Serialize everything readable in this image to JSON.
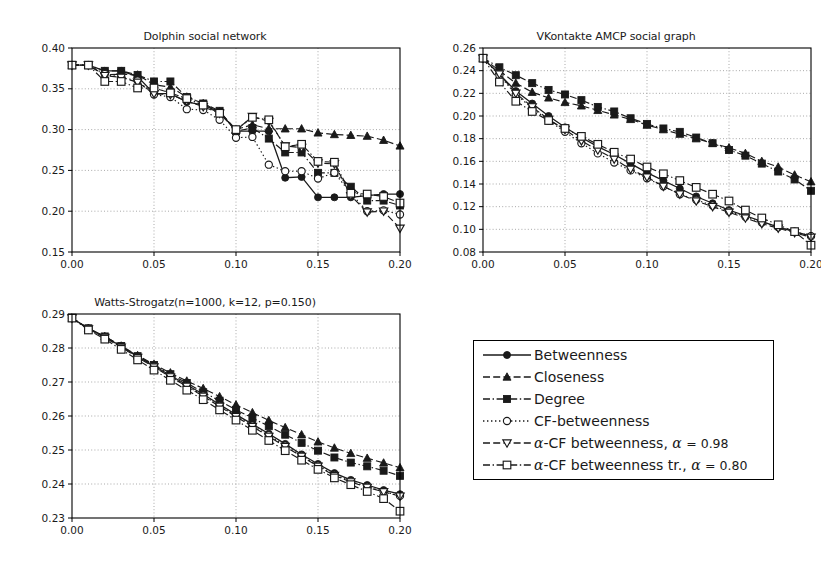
{
  "figure": {
    "background": "#ffffff",
    "ink": "#1a1a1a",
    "grid_color": "#9a9a9a"
  },
  "chart_data": [
    {
      "type": "line",
      "id": "dolphin",
      "title": "Dolphin social network",
      "xlabel": "",
      "ylabel": "",
      "xlim": [
        0.0,
        0.2
      ],
      "ylim": [
        0.15,
        0.4
      ],
      "xticks": [
        0.0,
        0.05,
        0.1,
        0.15,
        0.2
      ],
      "xticklabels": [
        "0.00",
        "0.05",
        "0.10",
        "0.15",
        "0.20"
      ],
      "yticks": [
        0.15,
        0.2,
        0.25,
        0.3,
        0.35,
        0.4
      ],
      "yticklabels": [
        "0.15",
        "0.20",
        "0.25",
        "0.30",
        "0.35",
        "0.40"
      ],
      "grid": true,
      "legend_position": "external",
      "x": [
        0.0,
        0.01,
        0.02,
        0.03,
        0.04,
        0.05,
        0.06,
        0.07,
        0.08,
        0.09,
        0.1,
        0.11,
        0.12,
        0.13,
        0.14,
        0.15,
        0.16,
        0.17,
        0.18,
        0.19,
        0.2
      ],
      "series": [
        {
          "name": "Betweenness",
          "values": [
            0.379,
            0.379,
            0.372,
            0.372,
            0.365,
            0.344,
            0.344,
            0.334,
            0.33,
            0.322,
            0.298,
            0.298,
            0.298,
            0.241,
            0.242,
            0.217,
            0.217,
            0.217,
            0.219,
            0.221,
            0.221
          ]
        },
        {
          "name": "Closeness",
          "values": [
            0.379,
            0.379,
            0.367,
            0.368,
            0.367,
            0.355,
            0.352,
            0.34,
            0.332,
            0.322,
            0.3,
            0.306,
            0.301,
            0.301,
            0.301,
            0.296,
            0.294,
            0.293,
            0.292,
            0.287,
            0.28
          ]
        },
        {
          "name": "Degree",
          "values": [
            0.379,
            0.379,
            0.372,
            0.372,
            0.367,
            0.359,
            0.359,
            0.34,
            0.332,
            0.323,
            0.298,
            0.302,
            0.289,
            0.272,
            0.272,
            0.247,
            0.247,
            0.23,
            0.213,
            0.213,
            0.207
          ]
        },
        {
          "name": "CF-betweenness",
          "values": [
            0.379,
            0.379,
            0.368,
            0.364,
            0.36,
            0.343,
            0.34,
            0.325,
            0.324,
            0.312,
            0.29,
            0.291,
            0.257,
            0.249,
            0.249,
            0.24,
            0.247,
            0.222,
            0.2,
            0.201,
            0.196
          ]
        },
        {
          "name": "alpha-CF betweenness",
          "values": [
            0.379,
            0.379,
            0.366,
            0.364,
            0.358,
            0.344,
            0.343,
            0.335,
            0.328,
            0.32,
            0.299,
            0.316,
            0.31,
            0.28,
            0.278,
            0.259,
            0.258,
            0.219,
            0.199,
            0.2,
            0.179
          ]
        },
        {
          "name": "alpha-CF betweenness tr.",
          "values": [
            0.379,
            0.379,
            0.359,
            0.359,
            0.351,
            0.351,
            0.345,
            0.338,
            0.33,
            0.32,
            0.3,
            0.315,
            0.312,
            0.279,
            0.282,
            0.261,
            0.26,
            0.222,
            0.221,
            0.218,
            0.21
          ]
        }
      ]
    },
    {
      "type": "line",
      "id": "vkontakte",
      "title": "VKontakte AMCP social graph",
      "xlabel": "",
      "ylabel": "",
      "xlim": [
        0.0,
        0.2
      ],
      "ylim": [
        0.08,
        0.26
      ],
      "xticks": [
        0.0,
        0.05,
        0.1,
        0.15,
        0.2
      ],
      "xticklabels": [
        "0.00",
        "0.05",
        "0.10",
        "0.15",
        "0.20"
      ],
      "yticks": [
        0.08,
        0.1,
        0.12,
        0.14,
        0.16,
        0.18,
        0.2,
        0.22,
        0.24,
        0.26
      ],
      "yticklabels": [
        "0.08",
        "0.10",
        "0.12",
        "0.14",
        "0.16",
        "0.18",
        "0.20",
        "0.22",
        "0.24",
        "0.26"
      ],
      "grid": true,
      "legend_position": "external",
      "x": [
        0.0,
        0.01,
        0.02,
        0.03,
        0.04,
        0.05,
        0.06,
        0.07,
        0.08,
        0.09,
        0.1,
        0.11,
        0.12,
        0.13,
        0.14,
        0.15,
        0.16,
        0.17,
        0.18,
        0.19,
        0.2
      ],
      "series": [
        {
          "name": "Betweenness",
          "values": [
            0.251,
            0.237,
            0.222,
            0.211,
            0.2,
            0.19,
            0.181,
            0.173,
            0.166,
            0.158,
            0.15,
            0.143,
            0.136,
            0.129,
            0.123,
            0.117,
            0.112,
            0.107,
            0.102,
            0.098,
            0.094
          ]
        },
        {
          "name": "Closeness",
          "values": [
            0.251,
            0.24,
            0.229,
            0.221,
            0.216,
            0.212,
            0.209,
            0.205,
            0.201,
            0.197,
            0.192,
            0.188,
            0.184,
            0.18,
            0.176,
            0.172,
            0.167,
            0.16,
            0.155,
            0.148,
            0.142
          ]
        },
        {
          "name": "Degree",
          "values": [
            0.251,
            0.243,
            0.236,
            0.229,
            0.223,
            0.219,
            0.214,
            0.208,
            0.204,
            0.198,
            0.193,
            0.189,
            0.186,
            0.181,
            0.176,
            0.17,
            0.165,
            0.158,
            0.151,
            0.144,
            0.134
          ]
        },
        {
          "name": "CF-betweenness",
          "values": [
            0.251,
            0.236,
            0.219,
            0.207,
            0.196,
            0.186,
            0.176,
            0.167,
            0.159,
            0.152,
            0.145,
            0.138,
            0.131,
            0.126,
            0.121,
            0.116,
            0.111,
            0.106,
            0.102,
            0.098,
            0.094
          ]
        },
        {
          "name": "alpha-CF betweenness",
          "values": [
            0.251,
            0.237,
            0.22,
            0.208,
            0.197,
            0.188,
            0.178,
            0.17,
            0.162,
            0.153,
            0.146,
            0.138,
            0.131,
            0.125,
            0.12,
            0.115,
            0.11,
            0.105,
            0.101,
            0.097,
            0.093
          ]
        },
        {
          "name": "alpha-CF betweenness tr.",
          "values": [
            0.251,
            0.23,
            0.213,
            0.204,
            0.196,
            0.189,
            0.182,
            0.175,
            0.168,
            0.162,
            0.155,
            0.149,
            0.143,
            0.137,
            0.131,
            0.125,
            0.117,
            0.11,
            0.104,
            0.098,
            0.086
          ]
        }
      ]
    },
    {
      "type": "line",
      "id": "watts-strogatz",
      "title": "Watts-Strogatz(n=1000, k=12, p=0.150)",
      "xlabel": "",
      "ylabel": "",
      "xlim": [
        0.0,
        0.2
      ],
      "ylim": [
        0.23,
        0.29
      ],
      "xticks": [
        0.0,
        0.05,
        0.1,
        0.15,
        0.2
      ],
      "xticklabels": [
        "0.00",
        "0.05",
        "0.10",
        "0.15",
        "0.20"
      ],
      "yticks": [
        0.23,
        0.24,
        0.25,
        0.26,
        0.27,
        0.28,
        0.29
      ],
      "yticklabels": [
        "0.23",
        "0.24",
        "0.25",
        "0.26",
        "0.27",
        "0.28",
        "0.29"
      ],
      "grid": true,
      "legend_position": "external",
      "x": [
        0.0,
        0.01,
        0.02,
        0.03,
        0.04,
        0.05,
        0.06,
        0.07,
        0.08,
        0.09,
        0.1,
        0.11,
        0.12,
        0.13,
        0.14,
        0.15,
        0.16,
        0.17,
        0.18,
        0.19,
        0.2
      ],
      "series": [
        {
          "name": "Betweenness",
          "values": [
            0.2888,
            0.2857,
            0.2833,
            0.2805,
            0.2775,
            0.2748,
            0.2719,
            0.2692,
            0.2664,
            0.2634,
            0.2604,
            0.2576,
            0.2548,
            0.2518,
            0.2487,
            0.2459,
            0.2432,
            0.2412,
            0.2397,
            0.2382,
            0.237
          ]
        },
        {
          "name": "Closeness",
          "values": [
            0.2888,
            0.2858,
            0.2834,
            0.2806,
            0.2778,
            0.2752,
            0.2727,
            0.2703,
            0.2681,
            0.2657,
            0.2633,
            0.261,
            0.2587,
            0.2566,
            0.2545,
            0.2524,
            0.2506,
            0.249,
            0.2476,
            0.2462,
            0.2448
          ]
        },
        {
          "name": "Degree",
          "values": [
            0.2888,
            0.2858,
            0.2834,
            0.2806,
            0.2776,
            0.275,
            0.2723,
            0.2697,
            0.267,
            0.2645,
            0.2618,
            0.2594,
            0.257,
            0.2545,
            0.2521,
            0.2498,
            0.2478,
            0.2463,
            0.2452,
            0.2439,
            0.2424
          ]
        },
        {
          "name": "CF-betweenness",
          "values": [
            0.2888,
            0.2857,
            0.2832,
            0.2803,
            0.2773,
            0.2745,
            0.2716,
            0.2688,
            0.266,
            0.263,
            0.26,
            0.2572,
            0.2543,
            0.2513,
            0.2483,
            0.2454,
            0.2427,
            0.2408,
            0.2392,
            0.2378,
            0.2365
          ]
        },
        {
          "name": "alpha-CF betweenness",
          "values": [
            0.2888,
            0.2856,
            0.2831,
            0.2802,
            0.2772,
            0.2744,
            0.2715,
            0.2687,
            0.2658,
            0.2628,
            0.2598,
            0.2569,
            0.254,
            0.251,
            0.2481,
            0.2452,
            0.2425,
            0.2406,
            0.239,
            0.2377,
            0.2364
          ]
        },
        {
          "name": "alpha-CF betweenness tr.",
          "values": [
            0.2888,
            0.2853,
            0.2826,
            0.2796,
            0.2765,
            0.2735,
            0.2705,
            0.2676,
            0.2648,
            0.2618,
            0.2588,
            0.2558,
            0.2528,
            0.2498,
            0.247,
            0.2443,
            0.2418,
            0.2398,
            0.2378,
            0.2357,
            0.232
          ]
        }
      ]
    }
  ],
  "legend": {
    "items": [
      {
        "label": "Betweenness",
        "marker": "filled-circle",
        "linestyle": "solid",
        "marker_name": "filled-circle-marker"
      },
      {
        "label": "Closeness",
        "marker": "filled-triangle-up",
        "linestyle": "dashed",
        "marker_name": "filled-triangle-up-marker"
      },
      {
        "label": "Degree",
        "marker": "filled-square",
        "linestyle": "dashdot",
        "marker_name": "filled-square-marker"
      },
      {
        "label": "CF-betweenness",
        "marker": "open-circle",
        "linestyle": "dotted",
        "marker_name": "open-circle-marker"
      },
      {
        "label": "α-CF betweenness, α = 0.98",
        "marker": "open-triangle-down",
        "linestyle": "dashed",
        "marker_name": "open-triangle-down-marker"
      },
      {
        "label": "α-CF betweenness tr., α = 0.80",
        "marker": "open-square",
        "linestyle": "dashdot",
        "marker_name": "open-square-marker"
      }
    ]
  }
}
